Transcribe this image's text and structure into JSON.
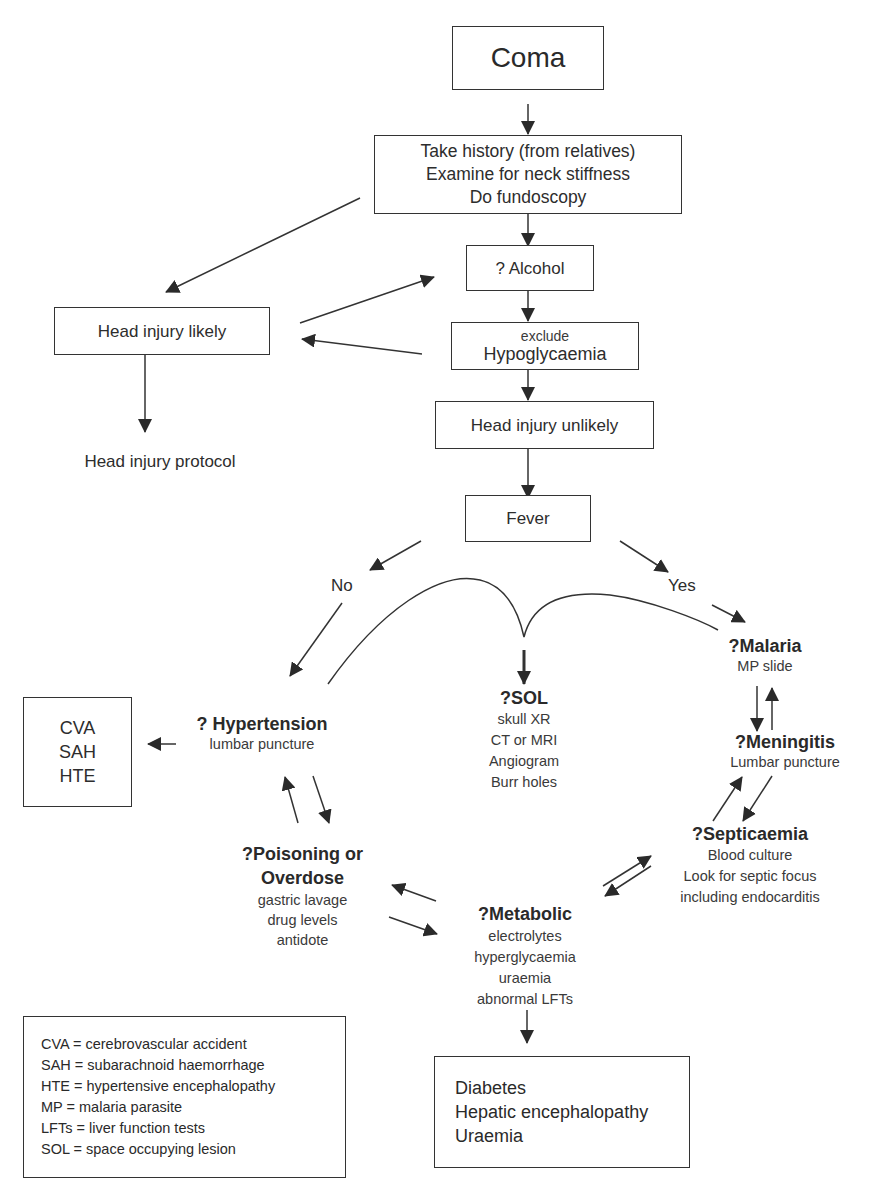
{
  "title": "Coma",
  "nodes": {
    "coma": {
      "label": "Coma"
    },
    "history": {
      "lines": [
        "Take history (from relatives)",
        "Examine for neck stiffness",
        "Do fundoscopy"
      ]
    },
    "alcohol": {
      "label": "? Alcohol"
    },
    "hypoglycaemia": {
      "small": "exclude",
      "label": "Hypoglycaemia"
    },
    "head_injury_likely": {
      "label": "Head injury likely"
    },
    "head_injury_protocol": {
      "label": "Head injury protocol"
    },
    "head_injury_unlikely": {
      "label": "Head injury unlikely"
    },
    "fever": {
      "label": "Fever"
    },
    "no": {
      "label": "No"
    },
    "yes": {
      "label": "Yes"
    },
    "hypertension": {
      "title": "? Hypertension",
      "lines": [
        "lumbar puncture"
      ]
    },
    "cva_box": {
      "lines": [
        "CVA",
        "SAH",
        "HTE"
      ]
    },
    "sol": {
      "title": "?SOL",
      "lines": [
        "skull XR",
        "CT or MRI",
        "Angiogram",
        "Burr holes"
      ]
    },
    "malaria": {
      "title": "?Malaria",
      "lines": [
        "MP slide"
      ]
    },
    "meningitis": {
      "title": "?Meningitis",
      "lines": [
        "Lumbar puncture"
      ]
    },
    "septicaemia": {
      "title": "?Septicaemia",
      "lines": [
        "Blood culture",
        "Look for septic focus",
        "including endocarditis"
      ]
    },
    "poisoning": {
      "title_lines": [
        "?Poisoning or",
        "Overdose"
      ],
      "lines": [
        "gastric lavage",
        "drug levels",
        "antidote"
      ]
    },
    "metabolic": {
      "title": "?Metabolic",
      "lines": [
        "electrolytes",
        "hyperglycaemia",
        "uraemia",
        "abnormal LFTs"
      ]
    },
    "outcome_box": {
      "lines": [
        "Diabetes",
        "Hepatic encephalopathy",
        "Uraemia"
      ]
    }
  },
  "legend": {
    "items": [
      "CVA = cerebrovascular accident",
      "SAH = subarachnoid haemorrhage",
      "HTE = hypertensive encephalopathy",
      "MP = malaria parasite",
      "LFTs = liver function tests",
      "SOL = space occupying lesion"
    ]
  },
  "colors": {
    "line": "#333333",
    "text": "#2d2d2d",
    "background": "#ffffff"
  }
}
